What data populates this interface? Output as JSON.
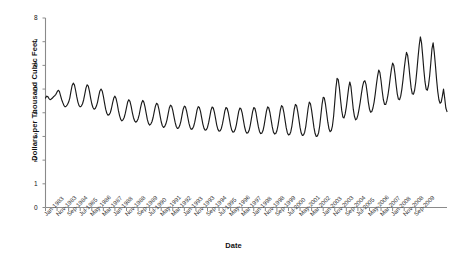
{
  "chart_data": {
    "type": "line",
    "title": "",
    "xlabel": "Date",
    "ylabel": "Dollars per Thousand Cubic Feet",
    "ylim": [
      0,
      8
    ],
    "ytick_values": [
      0,
      1,
      2,
      3,
      4,
      5,
      6,
      7,
      8
    ],
    "grid": false,
    "legend": null,
    "line_color": "#1a1a1a",
    "axis_color": "#808080",
    "background_color": "#ffffff",
    "x_start": "Jan-1983",
    "x_end": "Sep-2009",
    "x_frequency": "monthly",
    "xtick_labels": [
      "Jan-1983",
      "Nov-1983",
      "Sep-1984",
      "Jul-1985",
      "May-1986",
      "Mar-1987",
      "Jan-1988",
      "Nov-1988",
      "Sep-1989",
      "Jul-1990",
      "May-1991",
      "Mar-1992",
      "Jan-1993",
      "Nov-1993",
      "Sep-1994",
      "Jul-1995",
      "May-1996",
      "Mar-1997",
      "Jan-1998",
      "Nov-1998",
      "Sep-1999",
      "Jul-2000",
      "May-2001",
      "Mar-2002",
      "Jan-2003",
      "Nov-2003",
      "Sep-2004",
      "Jul-2005",
      "May-2006",
      "Mar-2007",
      "Jan-2008",
      "Nov-2008",
      "Sep-2009"
    ],
    "xtick_interval_months": 10,
    "values": [
      4.62,
      4.7,
      4.68,
      4.6,
      4.55,
      4.58,
      4.62,
      4.68,
      4.72,
      4.78,
      4.88,
      4.95,
      4.9,
      4.72,
      4.55,
      4.42,
      4.3,
      4.25,
      4.28,
      4.35,
      4.45,
      4.62,
      4.9,
      5.15,
      5.25,
      5.18,
      4.95,
      4.68,
      4.45,
      4.3,
      4.25,
      4.28,
      4.38,
      4.55,
      4.8,
      5.05,
      5.18,
      5.12,
      4.9,
      4.62,
      4.38,
      4.22,
      4.15,
      4.18,
      4.28,
      4.45,
      4.7,
      4.92,
      5.0,
      4.92,
      4.7,
      4.42,
      4.15,
      3.98,
      3.9,
      3.92,
      4.0,
      4.18,
      4.42,
      4.62,
      4.7,
      4.6,
      4.38,
      4.1,
      3.88,
      3.72,
      3.66,
      3.7,
      3.8,
      3.98,
      4.22,
      4.45,
      4.55,
      4.48,
      4.28,
      4.02,
      3.8,
      3.66,
      3.6,
      3.64,
      3.74,
      3.92,
      4.18,
      4.4,
      4.52,
      4.45,
      4.25,
      3.98,
      3.72,
      3.55,
      3.48,
      3.52,
      3.62,
      3.8,
      4.05,
      4.28,
      4.4,
      4.35,
      4.15,
      3.88,
      3.62,
      3.45,
      3.38,
      3.42,
      3.52,
      3.7,
      3.95,
      4.2,
      4.32,
      4.28,
      4.1,
      3.85,
      3.6,
      3.42,
      3.34,
      3.36,
      3.46,
      3.64,
      3.9,
      4.15,
      4.28,
      4.24,
      4.06,
      3.8,
      3.55,
      3.38,
      3.3,
      3.32,
      3.42,
      3.6,
      3.86,
      4.12,
      4.26,
      4.22,
      4.05,
      3.78,
      3.52,
      3.34,
      3.26,
      3.28,
      3.38,
      3.58,
      3.84,
      4.1,
      4.24,
      4.2,
      4.02,
      3.75,
      3.48,
      3.3,
      3.22,
      3.24,
      3.34,
      3.54,
      3.8,
      4.08,
      4.22,
      4.18,
      4.0,
      3.72,
      3.45,
      3.26,
      3.18,
      3.2,
      3.3,
      3.5,
      3.78,
      4.06,
      4.2,
      4.16,
      3.98,
      3.7,
      3.42,
      3.22,
      3.14,
      3.16,
      3.26,
      3.48,
      3.76,
      4.05,
      4.22,
      4.18,
      3.98,
      3.68,
      3.4,
      3.2,
      3.12,
      3.14,
      3.25,
      3.48,
      3.78,
      4.08,
      4.25,
      4.2,
      4.0,
      3.7,
      3.4,
      3.18,
      3.1,
      3.12,
      3.24,
      3.48,
      3.8,
      4.12,
      4.3,
      4.25,
      4.02,
      3.7,
      3.38,
      3.16,
      3.06,
      3.08,
      3.2,
      3.45,
      3.8,
      4.15,
      4.35,
      4.3,
      4.05,
      3.72,
      3.38,
      3.14,
      3.04,
      3.06,
      3.18,
      3.44,
      3.82,
      4.2,
      4.45,
      4.38,
      4.1,
      3.74,
      3.38,
      3.12,
      3.0,
      3.02,
      3.15,
      3.45,
      3.9,
      4.35,
      4.65,
      4.62,
      4.35,
      3.98,
      3.6,
      3.32,
      3.2,
      3.25,
      3.45,
      3.85,
      4.45,
      5.05,
      5.45,
      5.4,
      5.05,
      4.55,
      4.1,
      3.82,
      3.78,
      3.95,
      4.25,
      4.65,
      5.05,
      5.3,
      5.1,
      4.62,
      4.15,
      3.85,
      3.7,
      3.74,
      3.9,
      4.15,
      4.45,
      4.8,
      5.1,
      5.3,
      5.35,
      5.2,
      4.85,
      4.45,
      4.15,
      4.02,
      4.05,
      4.2,
      4.45,
      4.8,
      5.2,
      5.55,
      5.8,
      5.7,
      5.35,
      4.92,
      4.55,
      4.35,
      4.35,
      4.5,
      4.75,
      5.1,
      5.5,
      5.85,
      6.1,
      6.0,
      5.65,
      5.2,
      4.8,
      4.58,
      4.55,
      4.7,
      5.0,
      5.4,
      5.85,
      6.25,
      6.55,
      6.42,
      6.0,
      5.5,
      5.05,
      4.8,
      4.78,
      4.95,
      5.3,
      5.8,
      6.35,
      6.85,
      7.2,
      6.95,
      6.4,
      5.8,
      5.3,
      5.0,
      4.95,
      5.15,
      5.55,
      6.1,
      6.7,
      6.95,
      6.55,
      6.0,
      5.4,
      4.9,
      4.55,
      4.4,
      4.45,
      4.7,
      5.0,
      4.62,
      4.2,
      4.05
    ]
  },
  "axes": {
    "y_label_text": "Dollars per Thousand Cubic Feet",
    "x_label_text": "Date"
  }
}
